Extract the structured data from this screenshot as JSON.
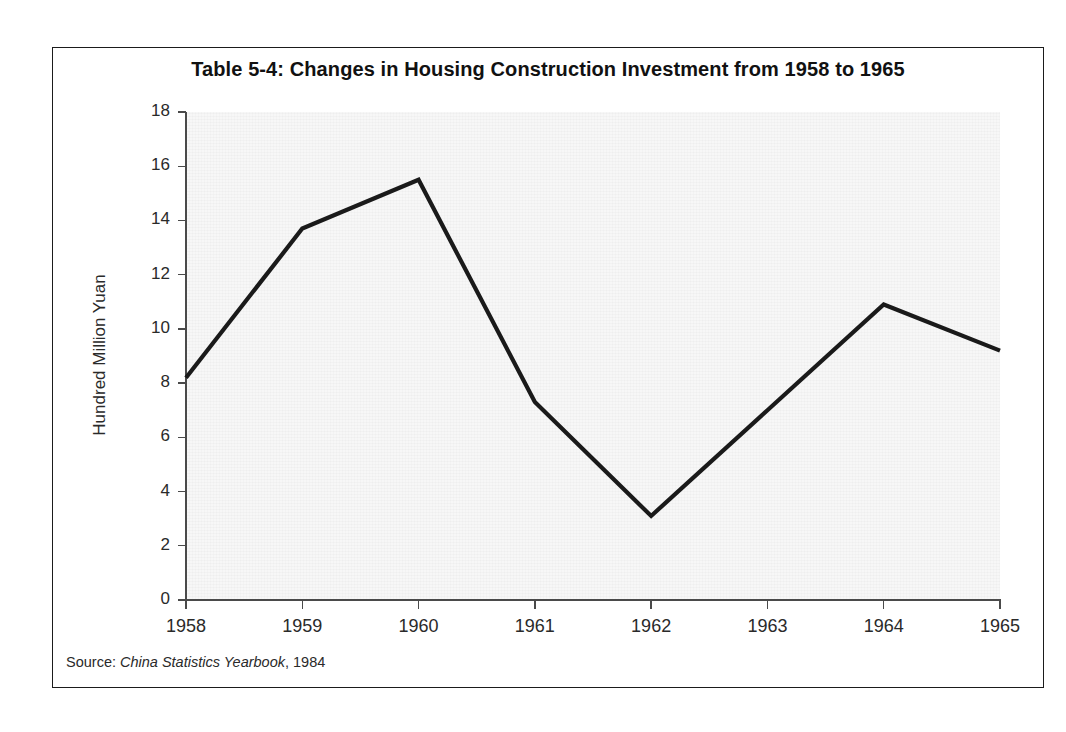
{
  "figure": {
    "title": "Table 5-4: Changes in Housing Construction Investment from 1958 to 1965",
    "source_prefix": "Source: ",
    "source_italic": "China Statistics Yearbook",
    "source_suffix": ", 1984",
    "frame_color": "#1b1b1b",
    "plot_background": "#f7f7f7",
    "line_color": "#1a1a1a",
    "axis_color": "#4a4a4a"
  },
  "chart_data": {
    "type": "line",
    "title": "Table 5-4: Changes in Housing Construction Investment from 1958 to 1965",
    "xlabel": "",
    "ylabel": "Hundred Million Yuan",
    "categories": [
      "1958",
      "1959",
      "1960",
      "1961",
      "1962",
      "1963",
      "1964",
      "1965"
    ],
    "x": [
      1958,
      1959,
      1960,
      1961,
      1962,
      1963,
      1964,
      1965
    ],
    "values": [
      8.2,
      13.7,
      15.5,
      7.3,
      3.1,
      7.0,
      10.9,
      9.2
    ],
    "series": [
      {
        "name": "Housing Construction Investment",
        "values": [
          8.2,
          13.7,
          15.5,
          7.3,
          3.1,
          7.0,
          10.9,
          9.2
        ]
      }
    ],
    "ylim": [
      0,
      18
    ],
    "y_ticks": [
      0,
      2,
      4,
      6,
      8,
      10,
      12,
      14,
      16,
      18
    ],
    "y_tick_labels": [
      "0",
      "2",
      "4",
      "6",
      "8",
      "10",
      "12",
      "14",
      "16",
      "18"
    ],
    "x_tick_labels": [
      "1958",
      "1959",
      "1960",
      "1961",
      "1962",
      "1963",
      "1964",
      "1965"
    ],
    "grid": false,
    "legend": "none",
    "markers": false,
    "units": "Hundred Million Yuan"
  }
}
